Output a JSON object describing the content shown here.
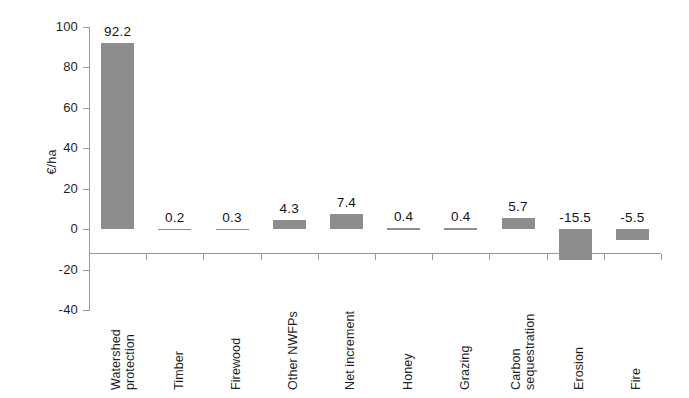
{
  "chart_data": {
    "type": "bar",
    "title": "",
    "xlabel": "",
    "ylabel": "€/ha",
    "ylim": [
      -40,
      100
    ],
    "yticks": [
      100,
      80,
      60,
      40,
      20,
      0,
      -20,
      -40
    ],
    "ytick_labels": [
      "100",
      "80",
      "60",
      "40",
      "20",
      "0",
      "-20",
      "-40"
    ],
    "grid": false,
    "legend": "none",
    "orientation": "vertical",
    "bar_color": "#8d8d8d",
    "categories": [
      "Watershed protection",
      "Timber",
      "Firewood",
      "Other NWFPs",
      "Net increment",
      "Honey",
      "Grazing",
      "Carbon sequestration",
      "Erosion",
      "Fire"
    ],
    "category_lines": [
      [
        "Watershed",
        "protection"
      ],
      [
        "Timber"
      ],
      [
        "Firewood"
      ],
      [
        "Other NWFPs"
      ],
      [
        "Net increment"
      ],
      [
        "Honey"
      ],
      [
        "Grazing"
      ],
      [
        "Carbon",
        "sequestration"
      ],
      [
        "Erosion"
      ],
      [
        "Fire"
      ]
    ],
    "values": [
      92.2,
      0.2,
      0.3,
      4.3,
      7.4,
      0.4,
      0.4,
      5.7,
      -15.5,
      -5.5
    ],
    "data_labels": [
      "92.2",
      "0.2",
      "0.3",
      "4.3",
      "7.4",
      "0.4",
      "0.4",
      "5.7",
      "-15.5",
      "-5.5"
    ]
  }
}
